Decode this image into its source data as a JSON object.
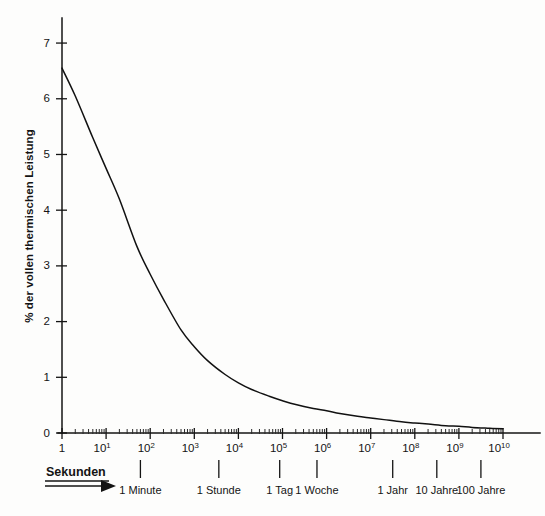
{
  "chart_data": {
    "type": "line",
    "title": "",
    "xlabel": "Sekunden",
    "ylabel": "% der vollen thermischen Leistung",
    "xscale": "log",
    "yscale": "linear",
    "xlim": [
      1,
      10000000000
    ],
    "ylim": [
      0,
      7.45
    ],
    "grid": false,
    "legend": null,
    "series": [
      {
        "name": "Nachzerfallswärme",
        "x": [
          1,
          2,
          5,
          10,
          20,
          50,
          100,
          200,
          500,
          1000,
          2000,
          5000,
          10000,
          20000,
          50000,
          100000,
          200000,
          500000,
          1000000,
          2000000,
          5000000,
          10000000,
          20000000,
          50000000,
          100000000,
          200000000,
          500000000,
          1000000000,
          2000000000,
          5000000000,
          10000000000
        ],
        "y": [
          6.55,
          6.05,
          5.3,
          4.75,
          4.2,
          3.35,
          2.85,
          2.4,
          1.85,
          1.55,
          1.3,
          1.05,
          0.9,
          0.78,
          0.66,
          0.58,
          0.51,
          0.44,
          0.4,
          0.35,
          0.3,
          0.27,
          0.24,
          0.2,
          0.18,
          0.16,
          0.13,
          0.12,
          0.1,
          0.085,
          0.075
        ]
      }
    ],
    "y_ticks": [
      {
        "value": 0,
        "label": "0"
      },
      {
        "value": 1,
        "label": "1"
      },
      {
        "value": 2,
        "label": "2"
      },
      {
        "value": 3,
        "label": "3"
      },
      {
        "value": 4,
        "label": "4"
      },
      {
        "value": 5,
        "label": "5"
      },
      {
        "value": 6,
        "label": "6"
      },
      {
        "value": 7,
        "label": "7"
      }
    ],
    "x_ticks": [
      {
        "exp": 0,
        "mantissa": "1",
        "exponent": ""
      },
      {
        "exp": 1,
        "mantissa": "10",
        "exponent": "1"
      },
      {
        "exp": 2,
        "mantissa": "10",
        "exponent": "2"
      },
      {
        "exp": 3,
        "mantissa": "10",
        "exponent": "3"
      },
      {
        "exp": 4,
        "mantissa": "10",
        "exponent": "4"
      },
      {
        "exp": 5,
        "mantissa": "10",
        "exponent": "5"
      },
      {
        "exp": 6,
        "mantissa": "10",
        "exponent": "6"
      },
      {
        "exp": 7,
        "mantissa": "10",
        "exponent": "7"
      },
      {
        "exp": 8,
        "mantissa": "10",
        "exponent": "8"
      },
      {
        "exp": 9,
        "mantissa": "10",
        "exponent": "9"
      },
      {
        "exp": 10,
        "mantissa": "10",
        "exponent": "10"
      }
    ],
    "time_annotations": [
      {
        "label": "1 Minute",
        "seconds": 60
      },
      {
        "label": "1 Stunde",
        "seconds": 3600
      },
      {
        "label": "1 Tag",
        "seconds": 86400
      },
      {
        "label": "1 Woche",
        "seconds": 604800
      },
      {
        "label": "1 Jahr",
        "seconds": 31557600
      },
      {
        "label": "10 Jahre",
        "seconds": 315576000
      },
      {
        "label": "100 Jahre",
        "seconds": 3155760000
      }
    ]
  },
  "style": {
    "ink": "#141414",
    "paper": "#fdfdfc",
    "curve_color": "#111111"
  },
  "geometry": {
    "x0": 62,
    "x1": 503,
    "y0": 433,
    "y_top": 18,
    "y_unit_px": 54.7,
    "decade_px": 44.1
  }
}
